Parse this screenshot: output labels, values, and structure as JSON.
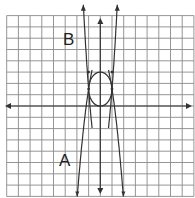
{
  "chart_data": {
    "type": "line",
    "title": "",
    "grid": true,
    "xlim": [
      -8,
      8
    ],
    "ylim": [
      -8,
      8
    ],
    "axes": {
      "x_arrows": true,
      "y_arrows": true
    },
    "labels": [
      {
        "text": "B",
        "x": -3,
        "y": 6
      },
      {
        "text": "A",
        "x": -3.5,
        "y": -4.7
      }
    ],
    "series": [
      {
        "name": "B",
        "kind": "parabola",
        "opens": "up",
        "equation": "y = 6.76x^2 - 5.26",
        "a": 6.76,
        "c": -5.26,
        "visible_x": [
          -1.45,
          1.45
        ],
        "clip_inner_below_y": 1.5
      },
      {
        "name": "A",
        "kind": "parabola",
        "opens": "down",
        "equation": "y = -3.3x^2 + 4.8",
        "a": -3.3,
        "c": 4.8,
        "visible_x": [
          -1.97,
          1.97
        ],
        "clip_inner_above_y": 1.5
      },
      {
        "name": "ellipse",
        "kind": "ellipse",
        "center": [
          0,
          1.5
        ],
        "rx": 1,
        "ry": 1.5
      }
    ],
    "points": [
      [
        -1,
        1.5
      ],
      [
        1,
        1.5
      ],
      [
        -1,
        3
      ],
      [
        1,
        3
      ]
    ]
  },
  "labels": {
    "a": "A",
    "b": "B"
  },
  "colors": {
    "grid": "#8a8a8a",
    "curve": "#333333",
    "axis": "#333333"
  }
}
